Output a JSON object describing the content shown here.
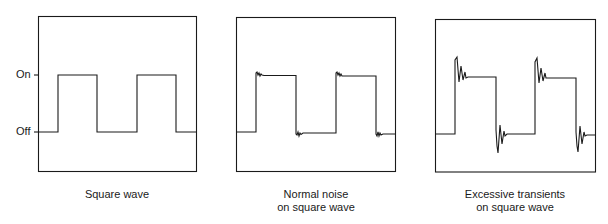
{
  "axis_labels": {
    "on": "On",
    "off": "Off"
  },
  "panels": [
    {
      "caption_line1": "Square wave",
      "caption_line2": ""
    },
    {
      "caption_line1": "Normal noise",
      "caption_line2": "on square wave"
    },
    {
      "caption_line1": "Excessive transients",
      "caption_line2": "on square wave"
    }
  ],
  "colors": {
    "line": "#1a1a1a",
    "background": "#ffffff"
  }
}
